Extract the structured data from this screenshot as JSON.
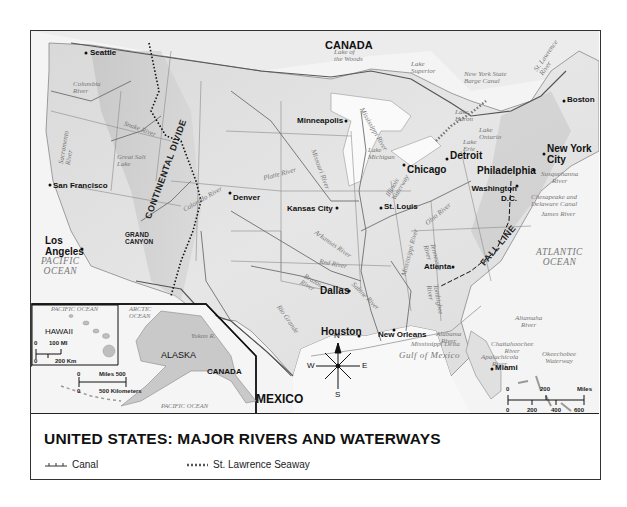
{
  "title": "UNITED STATES: MAJOR RIVERS AND WATERWAYS",
  "legend": [
    {
      "symbol": "canal-line",
      "label": "Canal"
    },
    {
      "symbol": "seaway-dots",
      "label": "St. Lawrence Seaway"
    }
  ],
  "countries": {
    "canada_main": "CANADA",
    "canada_inset": "CANADA",
    "mexico": "MEXICO"
  },
  "water_bodies": {
    "pacific": "PACIFIC\nOCEAN",
    "atlantic": "ATLANTIC\nOCEAN",
    "gulf": "Gulf of Mexico",
    "pacific_inset_top": "PACIFIC OCEAN",
    "arctic": "ARCTIC\nOCEAN",
    "pacific_inset_bottom": "PACIFIC OCEAN",
    "lake_woods": "Lake of\nthe Woods",
    "lake_superior": "Lake\nSuperior",
    "lake_huron": "Lake\nHuron",
    "lake_michigan": "Lake\nMichigan",
    "lake_erie": "Lake\nErie",
    "lake_ontario": "Lake\nOntario",
    "great_salt_lake": "Great Salt\nLake"
  },
  "cities": [
    {
      "name": "Seattle"
    },
    {
      "name": "San Francisco"
    },
    {
      "name": "Los Angeles"
    },
    {
      "name": "Denver"
    },
    {
      "name": "Minneapolis"
    },
    {
      "name": "Kansas City"
    },
    {
      "name": "St. Louis"
    },
    {
      "name": "Chicago"
    },
    {
      "name": "Detroit"
    },
    {
      "name": "Boston"
    },
    {
      "name": "New York City"
    },
    {
      "name": "Philadelphia"
    },
    {
      "name": "Washington D.C."
    },
    {
      "name": "Atlanta"
    },
    {
      "name": "Dallas"
    },
    {
      "name": "Houston"
    },
    {
      "name": "New Orleans"
    },
    {
      "name": "Miami"
    }
  ],
  "rivers": {
    "columbia": "Columbia\nRiver",
    "snake": "Snake River",
    "sacramento": "Sacramento\nRiver",
    "colorado": "Colorado River",
    "platte": "Platte River",
    "missouri": "Missouri River",
    "mississippi_upper": "Mississippi River",
    "mississippi_lower": "Mississippi River",
    "illinois": "Illinois\nWaterway",
    "ohio": "Ohio River",
    "arkansas": "Arkansas River",
    "red": "Red River",
    "brazos": "Brazos\nRiver",
    "sabine": "Sabine River",
    "rio_grande": "Rio Grande",
    "tennessee": "Tennessee\nRiver",
    "tombigbee": "Tombigbee\nRiver",
    "alabama": "Alabama\nRiver",
    "chattahoochee": "Chattahoochee\nRiver",
    "apalachicola": "Apalachicola\nRiver",
    "altamaha": "Altamaha\nRiver",
    "okeechobee": "Okeechobee\nWaterway",
    "susquehanna": "Susquehanna\nRiver",
    "chesapeake": "Chesapeake and\nDelaware Canal",
    "james": "James River",
    "ny_barge": "New York State\nBarge Canal",
    "st_lawrence": "St. Lawrence\nRiver",
    "yukon": "Yukon R.",
    "delta": "Mississippi Delta"
  },
  "features": {
    "continental_divide": "CONTINENTAL DIVIDE",
    "fall_line": "FALL LINE",
    "grand_canyon": "GRAND\nCANYON"
  },
  "insets": {
    "hawaii": {
      "label": "HAWAII",
      "scale_top": "100 MI",
      "scale_bottom": "200 Km",
      "zero_top": "0",
      "zero_bottom": "0"
    },
    "alaska": {
      "label": "ALASKA",
      "scale_top": "Miles 500",
      "scale_bottom": "500 Kilometers",
      "zero_top": "0",
      "zero_bottom": "0"
    }
  },
  "compass": {
    "n": "N",
    "s": "S",
    "e": "E",
    "w": "W"
  },
  "scale": {
    "miles_ticks": [
      "0",
      "200",
      "400"
    ],
    "miles_label": "Miles",
    "km_ticks": [
      "0",
      "200",
      "400",
      "600"
    ],
    "km_label": "Kilometers"
  }
}
